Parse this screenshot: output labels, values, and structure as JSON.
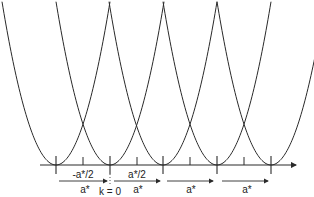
{
  "diagram": {
    "type": "extended-zone parabolas (free-electron bands repeated in reciprocal space)",
    "axis": {
      "y": 165,
      "x_start": 40,
      "x_end": 296
    },
    "lattice_points_x": [
      56,
      110,
      163,
      217,
      271
    ],
    "half_ticks_x": [
      83,
      137,
      190,
      244
    ],
    "curvature": 0.056,
    "labels": {
      "neg_half": "-a*/2",
      "pos_half": "a*/2",
      "origin": "k = 0",
      "astar": "a*"
    },
    "arrows": [
      {
        "x1": 59,
        "x2": 107,
        "label": "a*"
      },
      {
        "x1": 114,
        "x2": 160,
        "label": "a*"
      },
      {
        "x1": 167,
        "x2": 213,
        "label": "a*"
      },
      {
        "x1": 222,
        "x2": 268,
        "label": "a*"
      }
    ],
    "colors": {
      "line": "#2a2a2a",
      "background": "#ffffff"
    }
  }
}
